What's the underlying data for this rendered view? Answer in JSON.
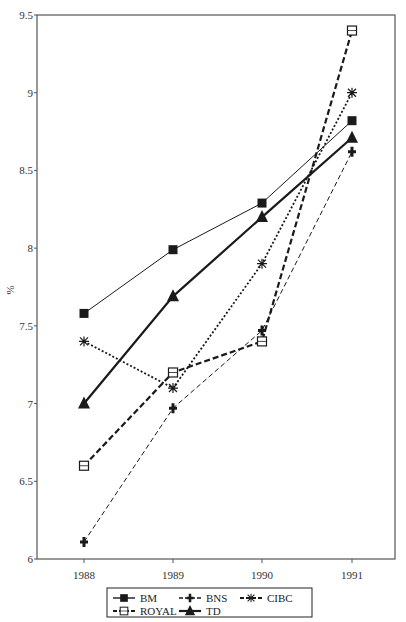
{
  "chart_data": {
    "type": "line",
    "title": "",
    "xlabel": "",
    "ylabel": "%",
    "x": [
      "1988",
      "1989",
      "1990",
      "1991"
    ],
    "ylim": [
      6,
      9.5
    ],
    "yticks": [
      "6",
      "6.5",
      "7",
      "7.5",
      "8",
      "8.5",
      "9",
      "9.5"
    ],
    "grid": false,
    "legend_position": "bottom",
    "series": [
      {
        "name": "BM",
        "values": [
          7.58,
          7.99,
          8.29,
          8.82
        ],
        "marker": "filled-square",
        "line": "solid-thin"
      },
      {
        "name": "BNS",
        "values": [
          6.11,
          6.97,
          7.47,
          8.62
        ],
        "marker": "plus",
        "line": "dashed-thin"
      },
      {
        "name": "CIBC",
        "values": [
          7.4,
          7.1,
          7.9,
          9.0
        ],
        "marker": "asterisk",
        "line": "dotted"
      },
      {
        "name": "ROYAL",
        "values": [
          6.6,
          7.2,
          7.4,
          9.4
        ],
        "marker": "open-square",
        "line": "dashed-thick"
      },
      {
        "name": "TD",
        "values": [
          7.0,
          7.69,
          8.2,
          8.71
        ],
        "marker": "filled-triangle",
        "line": "solid-thick"
      }
    ]
  },
  "legend": {
    "items": [
      "BM",
      "BNS",
      "CIBC",
      "ROYAL",
      "TD"
    ]
  },
  "colors": {
    "line": "#1a1a1a",
    "axis": "#555555",
    "background": "#ffffff"
  }
}
